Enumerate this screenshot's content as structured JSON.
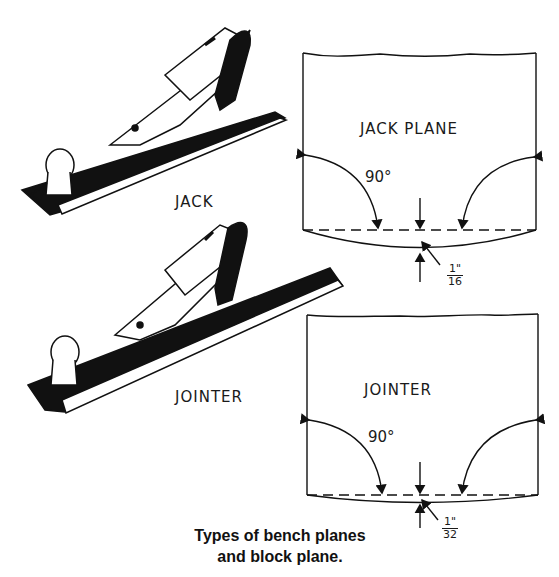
{
  "figure": {
    "caption_line1": "Types of bench planes",
    "caption_line2": "and block plane."
  },
  "planes": [
    {
      "label": "JACK"
    },
    {
      "label": "JOINTER"
    }
  ],
  "diagrams": [
    {
      "title": "JACK PLANE",
      "angle_label": "90°",
      "crown_num": "1\"",
      "crown_den": "16"
    },
    {
      "title": "JOINTER",
      "angle_label": "90°",
      "crown_num": "1\"",
      "crown_den": "32"
    }
  ]
}
